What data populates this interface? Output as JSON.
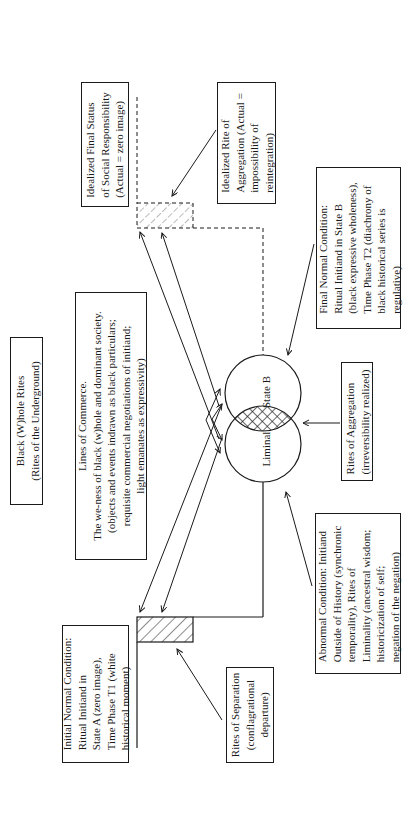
{
  "diagram": {
    "title": {
      "lines": [
        "Black (W)hole Rites",
        "(Rites of the Underground)"
      ]
    },
    "lines_of_commerce": {
      "lines": [
        "Lines of Commerce.",
        "The we-ness of black (w)hole and dominant society.",
        "(objects and events indrawn as black particulars;",
        "requisite commercial negotiations of initiand;",
        "light emanates as expressivity)"
      ]
    },
    "idealized_final_status": {
      "lines": [
        "Idealized Final Status",
        "of Social Responsibility",
        "(Actual  =  zero image)"
      ]
    },
    "idealized_rite_of_aggregation": {
      "lines": [
        "Idealized Rite of",
        "Aggregation (Actual =",
        "impossibility of",
        "reintegration)"
      ]
    },
    "final_normal_condition": {
      "lines": [
        "Final Normal Condition:",
        "Ritual Initiand in State B",
        "(black expressive wholeness),",
        "Time Phase T2 (diachrony of",
        "black historical series is",
        "regulative)"
      ]
    },
    "rites_of_aggregation": {
      "lines": [
        "Rites of Aggregation",
        "(irreversibility realized)"
      ]
    },
    "abnormal_condition": {
      "lines": [
        "Abnormal Condition: Initiand",
        "Outside of History (synchronic",
        "temporality), Rites of",
        "Liminality (ancestral wisdom;",
        "historicization of self;",
        "negation of the negation)"
      ]
    },
    "initial_normal_condition": {
      "lines": [
        "Initial Normal Condition:",
        "Ritual Initiand in",
        "State A (zero image),",
        "Time Phase T1 (white",
        "historical moment)"
      ]
    },
    "rites_of_separation": {
      "lines": [
        "Rites of Separation",
        "(conflagrational",
        "departure)"
      ]
    },
    "circles": {
      "state_b": "State B",
      "liminal": "Liminal"
    }
  }
}
